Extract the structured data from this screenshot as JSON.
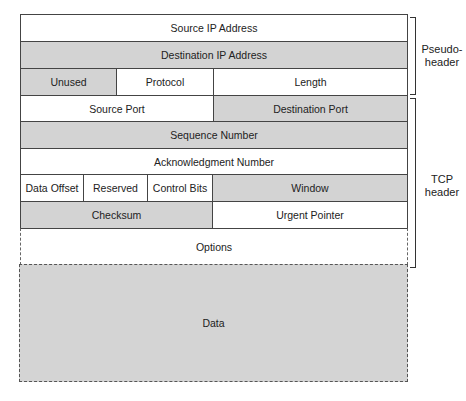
{
  "diagram": {
    "pseudo_header": {
      "row1": {
        "source_ip": "Source IP Address"
      },
      "row2": {
        "destination_ip": "Destination IP Address"
      },
      "row3": {
        "unused": "Unused",
        "protocol": "Protocol",
        "length": "Length"
      },
      "label": "Pseudo-\nheader"
    },
    "tcp_header": {
      "row1": {
        "source_port": "Source Port",
        "destination_port": "Destination Port"
      },
      "row2": {
        "sequence_number": "Sequence Number"
      },
      "row3": {
        "ack_number": "Acknowledgment Number"
      },
      "row4": {
        "data_offset": "Data Offset",
        "reserved": "Reserved",
        "control_bits": "Control Bits",
        "window": "Window"
      },
      "row5": {
        "checksum": "Checksum",
        "urgent_pointer": "Urgent Pointer"
      },
      "row6": {
        "options": "Options"
      },
      "label_line1": "TCP",
      "label_line2": "header"
    },
    "data": {
      "label": "Data"
    },
    "pseudo_label_line1": "Pseudo-",
    "pseudo_label_line2": "header",
    "colors": {
      "shaded": "#d3d3d3",
      "plain": "#ffffff",
      "border": "#444444"
    }
  }
}
